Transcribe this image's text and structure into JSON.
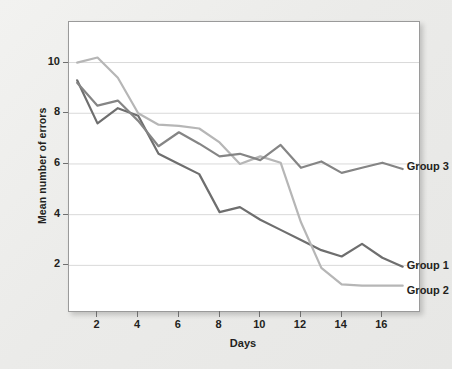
{
  "chart_data": {
    "type": "line",
    "title": "",
    "xlabel": "Days",
    "ylabel": "Mean number of errors",
    "x": [
      1,
      2,
      3,
      4,
      5,
      6,
      7,
      8,
      9,
      10,
      11,
      12,
      13,
      14,
      15,
      16,
      17
    ],
    "xlim": [
      0.6,
      17.8
    ],
    "ylim": [
      0.2,
      11.6
    ],
    "xticks": [
      2,
      4,
      6,
      8,
      10,
      12,
      14,
      16
    ],
    "yticks": [
      2,
      4,
      6,
      8,
      10
    ],
    "xtick_labels": [
      "2",
      "4",
      "6",
      "8",
      "10",
      "12",
      "14",
      "16"
    ],
    "ytick_labels": [
      "2",
      "4",
      "6",
      "8",
      "10"
    ],
    "grid": "horizontal",
    "legend_position": "inline-right-end-labels",
    "series": [
      {
        "name": "Group 1",
        "color": "#6e6e6e",
        "label_x": 17.25,
        "label_y": 1.95,
        "values": [
          9.3,
          7.6,
          8.2,
          7.9,
          6.4,
          6.0,
          5.6,
          4.1,
          4.3,
          3.8,
          3.4,
          3.0,
          2.6,
          2.35,
          2.85,
          2.3,
          1.95
        ]
      },
      {
        "name": "Group 2",
        "color": "#b6b6b6",
        "label_x": 17.25,
        "label_y": 0.95,
        "values": [
          10.0,
          10.2,
          9.4,
          8.0,
          7.55,
          7.5,
          7.4,
          6.85,
          6.0,
          6.3,
          6.05,
          3.7,
          1.9,
          1.25,
          1.2,
          1.2,
          1.2
        ]
      },
      {
        "name": "Group 3",
        "color": "#858585",
        "label_x": 17.25,
        "label_y": 5.85,
        "values": [
          9.2,
          8.3,
          8.5,
          7.7,
          6.7,
          7.25,
          6.8,
          6.3,
          6.4,
          6.15,
          6.75,
          5.85,
          6.1,
          5.65,
          5.85,
          6.05,
          5.8
        ]
      }
    ]
  }
}
